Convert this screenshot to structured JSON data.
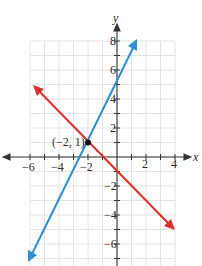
{
  "chart_data": {
    "type": "line",
    "title": "",
    "xlabel": "x",
    "ylabel": "y",
    "xlim": [
      -6,
      4
    ],
    "ylim": [
      -7.5,
      8
    ],
    "grid": true,
    "x_ticks": [
      -6,
      -4,
      -2,
      2,
      4
    ],
    "y_ticks": [
      -6,
      -4,
      -2,
      2,
      4,
      6,
      8
    ],
    "x_tick_labels": [
      "−6",
      "−4",
      "−2",
      "2",
      "4"
    ],
    "y_tick_labels": [
      "−6",
      "−4",
      "−2",
      "2",
      "4",
      "6",
      "8"
    ],
    "series": [
      {
        "name": "blue line",
        "equation": "y = 2x + 5",
        "slope": 2,
        "intercept": 5,
        "color": "#2b8fd0",
        "x_range": [
          -6.1,
          1.4
        ]
      },
      {
        "name": "red line",
        "equation": "y = -x - 1",
        "slope": -1,
        "intercept": -1,
        "color": "#d9302b",
        "x_range": [
          -5.7,
          3.9
        ]
      }
    ],
    "annotations": [
      {
        "text": "(−2, 1)",
        "x": -2,
        "y": 1,
        "type": "intersection-point"
      }
    ]
  },
  "labels": {
    "x_axis": "x",
    "y_axis": "y",
    "point": "(−2, 1)",
    "xt": [
      "−6",
      "−4",
      "−2",
      "2",
      "4"
    ],
    "yt": [
      "8",
      "6",
      "4",
      "2",
      "−2",
      "−4",
      "−6"
    ]
  },
  "colors": {
    "blue": "#2b8fd0",
    "red": "#d9302b",
    "grid": "#e6e3e3",
    "axis": "#333333"
  }
}
